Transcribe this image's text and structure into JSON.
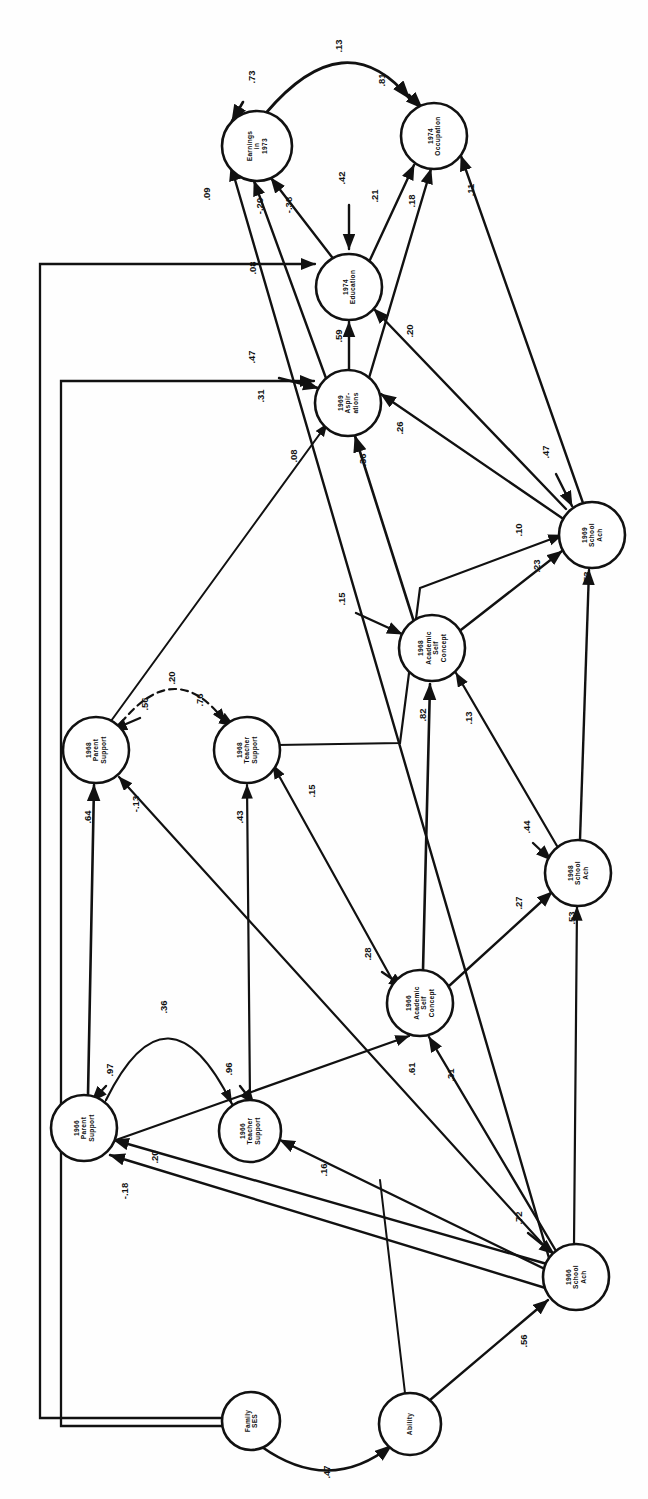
{
  "figure": {
    "kind": "path-diagram",
    "orientation": "rotated-90-ccw",
    "background": "#fefefe",
    "ink": "#111111"
  },
  "nodes": [
    {
      "id": "earn73",
      "lines": [
        "Earnings",
        "in",
        "1973"
      ],
      "cx": 257,
      "cy": 146,
      "r": 35
    },
    {
      "id": "occ74",
      "lines": [
        "1974",
        "Occupation"
      ],
      "cx": 434,
      "cy": 136,
      "r": 33
    },
    {
      "id": "edu74",
      "lines": [
        "1974",
        "Education"
      ],
      "cx": 349,
      "cy": 287,
      "r": 33
    },
    {
      "id": "asp69",
      "lines": [
        "1969",
        "Aspir-",
        "ations"
      ],
      "cx": 348,
      "cy": 403,
      "r": 33
    },
    {
      "id": "ach69",
      "lines": [
        "1969",
        "School",
        "Ach"
      ],
      "cx": 592,
      "cy": 535,
      "r": 33
    },
    {
      "id": "asc68",
      "lines": [
        "1968",
        "Academic",
        "Self",
        "Concept"
      ],
      "cx": 432,
      "cy": 648,
      "r": 33
    },
    {
      "id": "par68",
      "lines": [
        "1968",
        "Parent",
        "Support"
      ],
      "cx": 96,
      "cy": 750,
      "r": 33
    },
    {
      "id": "tea68",
      "lines": [
        "1968",
        "Teacher",
        "Support"
      ],
      "cx": 247,
      "cy": 750,
      "r": 33
    },
    {
      "id": "ach68",
      "lines": [
        "1968",
        "School",
        "Ach"
      ],
      "cx": 578,
      "cy": 873,
      "r": 33
    },
    {
      "id": "asc66",
      "lines": [
        "1966",
        "Academic",
        "Self",
        "Concept"
      ],
      "cx": 420,
      "cy": 1003,
      "r": 33
    },
    {
      "id": "par66",
      "lines": [
        "1966",
        "Parent",
        "Support"
      ],
      "cx": 84,
      "cy": 1128,
      "r": 33
    },
    {
      "id": "tea66",
      "lines": [
        "1966",
        "Teacher",
        "Support"
      ],
      "cx": 250,
      "cy": 1131,
      "r": 31
    },
    {
      "id": "ach66",
      "lines": [
        "1966",
        "School",
        "Ach"
      ],
      "cx": 576,
      "cy": 1277,
      "r": 33
    },
    {
      "id": "ses",
      "lines": [
        "Family",
        "SES"
      ],
      "cx": 251,
      "cy": 1421,
      "r": 29
    },
    {
      "id": "abil",
      "lines": [
        "Ability"
      ],
      "cx": 410,
      "cy": 1424,
      "r": 31
    }
  ],
  "paths": [
    {
      "id": "p-earn73-res",
      "value": ".73",
      "from": "residual",
      "to": "earn73",
      "lx": 255,
      "ly": 77
    },
    {
      "id": "p-occ74-res",
      "value": ".81",
      "from": "residual",
      "to": "occ74",
      "lx": 385,
      "ly": 80
    },
    {
      "id": "p-earn-occ",
      "value": ".13",
      "from": "earn73",
      "to": "occ74",
      "lx": 342,
      "ly": 46
    },
    {
      "id": "p-edu74-res",
      "value": ".42",
      "from": "residual",
      "to": "edu74",
      "lx": 345,
      "ly": 178
    },
    {
      "id": "p-asp69-res",
      "value": ".47",
      "from": "residual",
      "to": "asp69",
      "lx": 255,
      "ly": 357
    },
    {
      "id": "p-ach69-res",
      "value": ".47",
      "from": "residual",
      "to": "ach69",
      "lx": 549,
      "ly": 452
    },
    {
      "id": "p-asc68-res",
      "value": ".15",
      "from": "residual",
      "to": "asc68",
      "lx": 345,
      "ly": 599
    },
    {
      "id": "p-par68-res",
      "value": ".56",
      "from": "residual",
      "to": "par68",
      "lx": 148,
      "ly": 704
    },
    {
      "id": "p-tea68-res",
      "value": ".76",
      "from": "residual",
      "to": "tea68",
      "lx": 203,
      "ly": 700
    },
    {
      "id": "p-ach68-res",
      "value": ".44",
      "from": "residual",
      "to": "ach68",
      "lx": 530,
      "ly": 827
    },
    {
      "id": "p-asc66-res",
      "value": ".28",
      "from": "residual",
      "to": "asc66",
      "lx": 371,
      "ly": 954
    },
    {
      "id": "p-par66-res",
      "value": ".97",
      "from": "residual",
      "to": "par66",
      "lx": 113,
      "ly": 1070
    },
    {
      "id": "p-tea66-res",
      "value": ".96",
      "from": "residual",
      "to": "tea66",
      "lx": 232,
      "ly": 1069
    },
    {
      "id": "p-ach66-res",
      "value": ".72",
      "from": "residual",
      "to": "ach66",
      "lx": 522,
      "ly": 1218
    },
    {
      "id": "p-par68-tea68",
      "value": ".20",
      "from": "par68",
      "to": "tea68",
      "lx": 175,
      "ly": 678
    },
    {
      "id": "p-par66-tea66",
      "value": ".36",
      "from": "par66",
      "to": "tea66",
      "lx": 167,
      "ly": 1007
    },
    {
      "id": "p-ses-abil",
      "value": ".47",
      "from": "ses",
      "to": "abil",
      "lx": 330,
      "ly": 1472
    },
    {
      "id": "p-edu-earn",
      "value": "-.38",
      "from": "edu74",
      "to": "earn73",
      "lx": 292,
      "ly": 205
    },
    {
      "id": "p-asp-earn",
      "value": "-.20",
      "from": "asp69",
      "to": "earn73",
      "lx": 263,
      "ly": 206
    },
    {
      "id": "p-ach66-earn",
      "value": ".09",
      "from": "ach66",
      "to": "earn73",
      "lx": 210,
      "ly": 194
    },
    {
      "id": "p-edu-occ",
      "value": ".21",
      "from": "edu74",
      "to": "occ74",
      "lx": 378,
      "ly": 196
    },
    {
      "id": "p-asp-occ",
      "value": ".18",
      "from": "asp69",
      "to": "occ74",
      "lx": 415,
      "ly": 201
    },
    {
      "id": "p-ach69-occ",
      "value": ".11",
      "from": "ach69",
      "to": "occ74",
      "lx": 474,
      "ly": 190
    },
    {
      "id": "p-asp-edu",
      "value": ".59",
      "from": "asp69",
      "to": "edu74",
      "lx": 342,
      "ly": 336
    },
    {
      "id": "p-ach69-edu",
      "value": ".20",
      "from": "ach69",
      "to": "edu74",
      "lx": 413,
      "ly": 331
    },
    {
      "id": "p-ses-edu",
      "value": ".08",
      "from": "ses",
      "to": "edu74",
      "lx": 256,
      "ly": 268
    },
    {
      "id": "p-ses-asp",
      "value": ".31",
      "from": "ses",
      "to": "asp69",
      "lx": 264,
      "ly": 396
    },
    {
      "id": "p-ach69-asp",
      "value": ".26",
      "from": "ach69",
      "to": "asp69",
      "lx": 403,
      "ly": 428
    },
    {
      "id": "p-par68-asp",
      "value": ".08",
      "from": "par68",
      "to": "asp69",
      "lx": 297,
      "ly": 456
    },
    {
      "id": "p-asc68-asp",
      "value": ".36",
      "from": "asc68",
      "to": "asp69",
      "lx": 366,
      "ly": 460
    },
    {
      "id": "p-asc68-ach69",
      "value": ".23",
      "from": "asc68",
      "to": "ach69",
      "lx": 540,
      "ly": 566
    },
    {
      "id": "p-tea68-ach69",
      "value": ".10",
      "from": "tea68",
      "to": "ach69",
      "lx": 522,
      "ly": 530
    },
    {
      "id": "p-ach68-ach69",
      "value": ".53",
      "from": "ach68",
      "to": "ach69",
      "lx": 590,
      "ly": 578
    },
    {
      "id": "p-asc66-asc68",
      "value": ".82",
      "from": "asc66",
      "to": "asc68",
      "lx": 426,
      "ly": 715
    },
    {
      "id": "p-ach68-asc68",
      "value": ".13",
      "from": "ach68",
      "to": "asc68",
      "lx": 472,
      "ly": 718
    },
    {
      "id": "p-par66-par68",
      "value": ".64",
      "from": "par66",
      "to": "par68",
      "lx": 91,
      "ly": 817
    },
    {
      "id": "p-ach66-par68",
      "value": "-.13",
      "from": "ach66",
      "to": "par68",
      "lx": 139,
      "ly": 804
    },
    {
      "id": "p-tea66-tea68",
      "value": ".43",
      "from": "tea66",
      "to": "tea68",
      "lx": 243,
      "ly": 817
    },
    {
      "id": "p-asc66-tea68",
      "value": ".15",
      "from": "asc66",
      "to": "tea68",
      "lx": 315,
      "ly": 791
    },
    {
      "id": "p-ach66-ach68",
      "value": ".53",
      "from": "ach66",
      "to": "ach68",
      "lx": 575,
      "ly": 918
    },
    {
      "id": "p-asc66-ach68",
      "value": ".27",
      "from": "asc66",
      "to": "ach68",
      "lx": 522,
      "ly": 903
    },
    {
      "id": "p-ach66-asc66",
      "value": ".61",
      "from": "ach66",
      "to": "asc66",
      "lx": 415,
      "ly": 1069
    },
    {
      "id": "p-par66x-asc66",
      "value": ".31",
      "from": "par66",
      "to": "asc66",
      "lx": 454,
      "ly": 1075
    },
    {
      "id": "p-ach66-par66",
      "value": "-.18",
      "from": "ach66",
      "to": "par66",
      "lx": 128,
      "ly": 1191
    },
    {
      "id": "p-ach66-par66b",
      "value": ".20",
      "from": "ach66",
      "to": "par66",
      "lx": 158,
      "ly": 1157
    },
    {
      "id": "p-ach66-tea66",
      "value": ".16",
      "from": "ach66",
      "to": "tea66",
      "lx": 327,
      "ly": 1170
    },
    {
      "id": "p-abil-ach66",
      "value": ".56",
      "from": "abil",
      "to": "ach66",
      "lx": 527,
      "ly": 1341
    }
  ]
}
